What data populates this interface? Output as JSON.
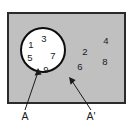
{
  "figure": {
    "type": "venn-diagram",
    "title": "",
    "universal_set": {
      "shape": "rectangle",
      "fill_color": "#c0c0c0",
      "border_color": "#2b2b2b"
    },
    "set_a": {
      "shape": "circle",
      "fill_color": "#ffffff",
      "border_color": "#000000",
      "label": "A",
      "elements": [
        "1",
        "3",
        "5",
        "7",
        "9"
      ]
    },
    "complement": {
      "label": "A'",
      "elements": [
        "2",
        "4",
        "6",
        "8"
      ]
    },
    "members": [
      {
        "value": "1",
        "region": "set-a",
        "x": 31,
        "y": 45
      },
      {
        "value": "3",
        "region": "set-a",
        "x": 44,
        "y": 39
      },
      {
        "value": "5",
        "region": "set-a",
        "x": 30,
        "y": 58
      },
      {
        "value": "7",
        "region": "set-a",
        "x": 53,
        "y": 56
      },
      {
        "value": "9",
        "region": "set-a",
        "x": 46,
        "y": 70
      },
      {
        "value": "4",
        "region": "complement",
        "x": 106,
        "y": 41
      },
      {
        "value": "2",
        "region": "complement",
        "x": 85,
        "y": 52
      },
      {
        "value": "8",
        "region": "complement",
        "x": 105,
        "y": 62
      },
      {
        "value": "6",
        "region": "complement",
        "x": 80,
        "y": 67
      }
    ],
    "callouts": [
      {
        "label": "A",
        "label_x": 25,
        "label_y": 117,
        "tip_x": 38,
        "tip_y": 70
      },
      {
        "label": "A'",
        "label_x": 91,
        "label_y": 117,
        "tip_x": 70,
        "tip_y": 79
      }
    ]
  }
}
